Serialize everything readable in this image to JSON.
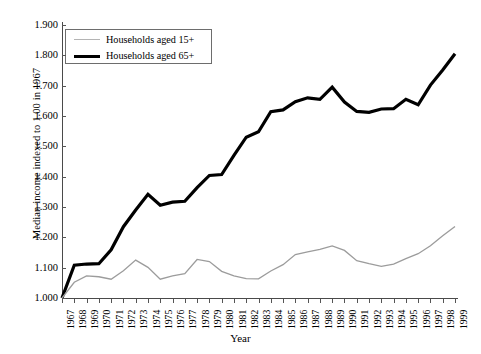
{
  "chart_data": {
    "type": "line",
    "title": "",
    "xlabel": "Year",
    "ylabel": "Median income indexed to 1.00 in 1967",
    "xlim": [
      1967,
      1999
    ],
    "ylim": [
      1.0,
      1.9
    ],
    "ytick_step": 0.1,
    "grid": false,
    "legend_position": "top-left",
    "x": [
      1967,
      1968,
      1969,
      1970,
      1971,
      1972,
      1973,
      1974,
      1975,
      1976,
      1977,
      1978,
      1979,
      1980,
      1981,
      1982,
      1983,
      1984,
      1985,
      1986,
      1987,
      1988,
      1989,
      1990,
      1991,
      1992,
      1993,
      1994,
      1995,
      1996,
      1997,
      1998,
      1999
    ],
    "categories": [
      "1967",
      "1968",
      "1969",
      "1970",
      "1971",
      "1972",
      "1973",
      "1974",
      "1975",
      "1976",
      "1977",
      "1978",
      "1979",
      "1980",
      "1981",
      "1982",
      "1983",
      "1984",
      "1985",
      "1986",
      "1987",
      "1988",
      "1989",
      "1990",
      "1991",
      "1992",
      "1993",
      "1994",
      "1995",
      "1996",
      "1997",
      "1998",
      "1999"
    ],
    "ytick_labels": [
      "1.000",
      "1.100",
      "1.200",
      "1.300",
      "1.400",
      "1.500",
      "1.600",
      "1.700",
      "1.800",
      "1.900"
    ],
    "ytick_values": [
      1.0,
      1.1,
      1.2,
      1.3,
      1.4,
      1.5,
      1.6,
      1.7,
      1.8,
      1.9
    ],
    "series": [
      {
        "name": "Households aged 15+",
        "color": "#9c9c9c",
        "width": 1.3,
        "values": [
          1.0,
          1.052,
          1.073,
          1.07,
          1.062,
          1.09,
          1.125,
          1.101,
          1.062,
          1.073,
          1.08,
          1.127,
          1.12,
          1.088,
          1.073,
          1.064,
          1.063,
          1.089,
          1.11,
          1.143,
          1.152,
          1.16,
          1.172,
          1.157,
          1.123,
          1.113,
          1.104,
          1.112,
          1.13,
          1.146,
          1.172,
          1.205,
          1.236
        ]
      },
      {
        "name": "Households aged 65+",
        "color": "#000000",
        "width": 3.2,
        "values": [
          1.0,
          1.108,
          1.112,
          1.113,
          1.159,
          1.235,
          1.29,
          1.342,
          1.306,
          1.316,
          1.319,
          1.364,
          1.404,
          1.407,
          1.47,
          1.53,
          1.548,
          1.614,
          1.62,
          1.647,
          1.66,
          1.655,
          1.695,
          1.646,
          1.615,
          1.612,
          1.623,
          1.624,
          1.655,
          1.637,
          1.702,
          1.752,
          1.805
        ]
      }
    ]
  },
  "legend": {
    "items": [
      {
        "label": "Households aged 15+"
      },
      {
        "label": "Households aged 65+"
      }
    ]
  },
  "axes": {
    "x_title": "Year",
    "y_title": "Median income indexed to 1.00 in 1967"
  }
}
